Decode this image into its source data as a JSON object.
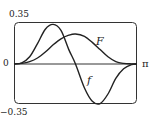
{
  "chart_data": {
    "type": "line",
    "title": "",
    "xlabel": "",
    "ylabel": "",
    "xlim": [
      0,
      3.14159
    ],
    "ylim": [
      -0.35,
      0.35
    ],
    "grid": false,
    "legend": "none (curves labeled inline)",
    "tick_labels": {
      "y_top": "0.35",
      "y_zero": "0",
      "y_bottom": "−0.35",
      "x_right": "π"
    },
    "series": [
      {
        "name": "f",
        "x": [
          0,
          0.2,
          0.4,
          0.6,
          0.8,
          1.0,
          1.2,
          1.4,
          1.5708,
          1.8,
          2.0,
          2.2,
          2.4,
          2.6,
          2.8,
          3.0,
          3.14159
        ],
        "values": [
          0,
          0.01,
          0.06,
          0.17,
          0.29,
          0.33,
          0.28,
          0.12,
          0,
          -0.2,
          -0.31,
          -0.33,
          -0.25,
          -0.12,
          -0.04,
          -0.005,
          0
        ]
      },
      {
        "name": "F",
        "x": [
          0,
          0.2,
          0.4,
          0.6,
          0.8,
          1.0,
          1.2,
          1.4,
          1.5708,
          1.8,
          2.0,
          2.2,
          2.4,
          2.6,
          2.8,
          3.0,
          3.14159
        ],
        "values": [
          0,
          0.005,
          0.02,
          0.05,
          0.1,
          0.16,
          0.21,
          0.24,
          0.25,
          0.23,
          0.18,
          0.12,
          0.06,
          0.02,
          0.005,
          0.001,
          0
        ]
      }
    ],
    "annotations": [
      {
        "text": "F",
        "near": "F curve descending right side"
      },
      {
        "text": "f",
        "near": "f curve descending middle"
      }
    ]
  },
  "labels": {
    "y_top": "0.35",
    "y_zero": "0",
    "y_bottom": "−0.35",
    "x_pi": "π",
    "curve_F": "F",
    "curve_f": "f"
  }
}
